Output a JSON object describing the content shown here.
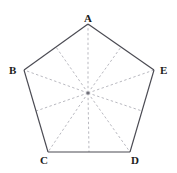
{
  "figure": {
    "type": "geometry-diagram",
    "shape": "regular-pentagon",
    "background_color": "#ffffff",
    "outline_color": "#4a4a52",
    "dashed_color": "#b9b9c0",
    "center_dot_color": "#6f6f78",
    "label_color": "#1c1c1c",
    "labels": {
      "A": "A",
      "B": "B",
      "C": "C",
      "D": "D",
      "E": "E"
    },
    "vertices": [
      {
        "name": "A",
        "x": 88,
        "y": 24
      },
      {
        "name": "B",
        "x": 24,
        "y": 70
      },
      {
        "name": "C",
        "x": 48,
        "y": 152
      },
      {
        "name": "D",
        "x": 130,
        "y": 152
      },
      {
        "name": "E",
        "x": 154,
        "y": 70
      }
    ],
    "center": {
      "name": "O",
      "x": 88,
      "y": 93
    },
    "edge_midpoints": [
      {
        "name": "M-AB",
        "x": 56,
        "y": 47
      },
      {
        "name": "M-BC",
        "x": 36,
        "y": 111
      },
      {
        "name": "M-CD",
        "x": 89,
        "y": 152
      },
      {
        "name": "M-DE",
        "x": 142,
        "y": 111
      },
      {
        "name": "M-EA",
        "x": 121,
        "y": 47
      }
    ],
    "edges": [
      {
        "name": "edge-AB",
        "from": "A",
        "to": "B",
        "style": "solid"
      },
      {
        "name": "edge-BC",
        "from": "B",
        "to": "C",
        "style": "solid"
      },
      {
        "name": "edge-CD",
        "from": "C",
        "to": "D",
        "style": "solid"
      },
      {
        "name": "edge-DE",
        "from": "D",
        "to": "E",
        "style": "solid"
      },
      {
        "name": "edge-EA",
        "from": "E",
        "to": "A",
        "style": "solid"
      }
    ],
    "radii": [
      {
        "name": "radius-OA",
        "to": "A",
        "style": "dashed"
      },
      {
        "name": "radius-OB",
        "to": "B",
        "style": "dashed"
      },
      {
        "name": "radius-OC",
        "to": "C",
        "style": "dashed"
      },
      {
        "name": "radius-OD",
        "to": "D",
        "style": "dashed"
      },
      {
        "name": "radius-OE",
        "to": "E",
        "style": "dashed"
      }
    ],
    "apothems": [
      {
        "name": "apothem-O-AB",
        "to": "M-AB",
        "style": "dashed"
      },
      {
        "name": "apothem-O-BC",
        "to": "M-BC",
        "style": "dashed"
      },
      {
        "name": "apothem-O-CD",
        "to": "M-CD",
        "style": "dashed"
      },
      {
        "name": "apothem-O-DE",
        "to": "M-DE",
        "style": "dashed"
      },
      {
        "name": "apothem-O-EA",
        "to": "M-EA",
        "style": "dashed"
      }
    ]
  }
}
